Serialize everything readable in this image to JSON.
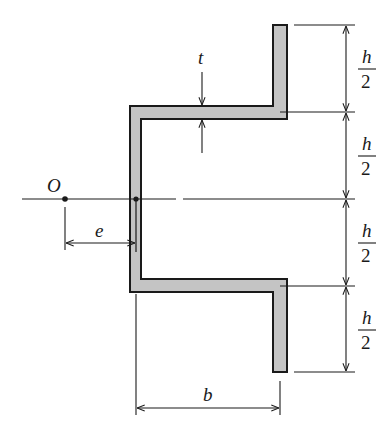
{
  "diagram": {
    "type": "cross-section",
    "colors": {
      "section_fill": "#c4c4c4",
      "stroke": "#1a1a1a",
      "background": "#ffffff"
    },
    "labels": {
      "point": "O",
      "eccentricity": "e",
      "thickness": "t",
      "width": "b",
      "height_numerator": "h",
      "height_denominator": "2"
    },
    "dimensions": [
      {
        "segment": 1,
        "label": "h/2"
      },
      {
        "segment": 2,
        "label": "h/2"
      },
      {
        "segment": 3,
        "label": "h/2"
      },
      {
        "segment": 4,
        "label": "h/2"
      }
    ]
  }
}
